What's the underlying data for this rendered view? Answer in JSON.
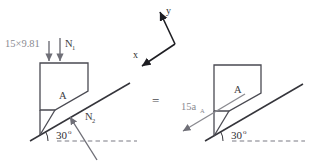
{
  "figure": {
    "equals_sign": "=",
    "colors": {
      "incline": "#35353b",
      "block_outline": "#4a4a52",
      "force_arrow": "#6f6f77",
      "axis_arrow": "#1d1d22",
      "dashed_ground": "#7b7b83",
      "text_dark": "#2e2e33",
      "text_light": "#8a8a90",
      "background": "#ffffff"
    }
  },
  "axes": {
    "x_label": "x",
    "y_label": "y",
    "description": "rotated coordinate axes, y up-right, x down-left"
  },
  "left_diagram": {
    "name": "free-body-diagram",
    "block_label": "A",
    "angle_value": "30",
    "angle_unit": "o",
    "forces": [
      {
        "name": "weight",
        "label": "15×9.81",
        "direction": "down"
      },
      {
        "name": "normal-upper",
        "label": "N",
        "subscript": "1",
        "direction": "down"
      },
      {
        "name": "normal-surface",
        "label": "N",
        "subscript": "2",
        "direction": "up-left perpendicular to incline"
      }
    ]
  },
  "right_diagram": {
    "name": "kinetic-diagram",
    "block_label": "A",
    "angle_value": "30",
    "angle_unit": "o",
    "vectors": [
      {
        "name": "inertia-term",
        "label": "15a",
        "subscript": "A",
        "direction": "down-left along incline"
      }
    ]
  }
}
